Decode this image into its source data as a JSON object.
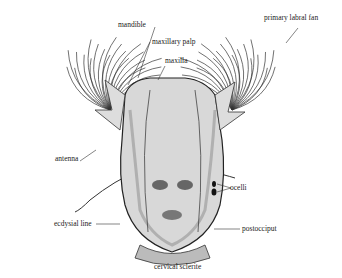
{
  "figure": {
    "labels": {
      "mandible": "mandible",
      "maxillary_palp": "maxillary palp",
      "maxilla": "maxilla",
      "primary_labral_fan": "primary labral fan",
      "antenna": "antenna",
      "ocelli": "ocelli",
      "ecdysial_line": "ecdysial line",
      "postocciput": "postocciput",
      "cervical_sclerite": "cervical sclerite"
    },
    "colors": {
      "ink": "#222222",
      "stipple": "#555555",
      "background": "#ffffff"
    }
  }
}
